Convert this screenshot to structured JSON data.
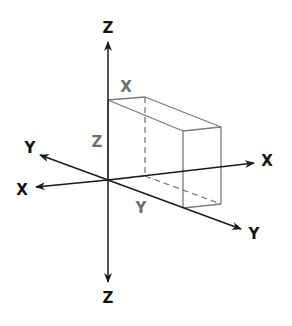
{
  "diagram": {
    "colors": {
      "axis": "#1a1a1a",
      "box": "#7a7a7a",
      "axis_label": "#111111",
      "dimension_label": "#6f6f6f",
      "background": "#ffffff"
    },
    "axis_labels": {
      "z_top": "Z",
      "z_bottom": "Z",
      "x_positive": "X",
      "x_negative": "X",
      "y_positive": "Y",
      "y_negative": "Y"
    },
    "dimension_labels": {
      "width": "X",
      "height": "Z",
      "depth": "Y"
    }
  }
}
